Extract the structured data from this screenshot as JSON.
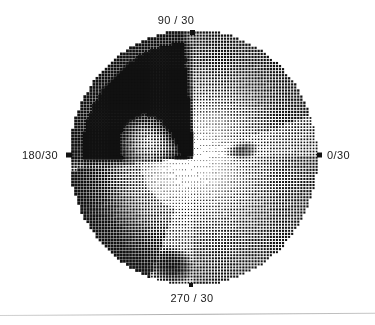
{
  "plot": {
    "kind": "visual-field-grayscale",
    "background_color": "#ffffff",
    "ink_color": "#111111",
    "center_x": 192,
    "center_y": 156,
    "radius_x": 124,
    "radius_y": 128,
    "dot_pitch": 3.05,
    "labels": {
      "top": "90 / 30",
      "left": "180/30",
      "right": "0/30",
      "bottom": "270 / 30"
    }
  },
  "chart_data": {
    "type": "heatmap",
    "title": "",
    "subtitle": "",
    "xlabel": "",
    "ylabel": "",
    "projection": "polar",
    "grid": false,
    "legend_position": "none",
    "shading": "halftone-dither",
    "radial_extent_deg": 30,
    "meridian_ticks": [
      {
        "angle_deg": 0,
        "label": "0/30"
      },
      {
        "angle_deg": 90,
        "label": "90 / 30"
      },
      {
        "angle_deg": 180,
        "label": "180/30"
      },
      {
        "angle_deg": 270,
        "label": "270 / 30"
      }
    ],
    "value_range": [
      0,
      1
    ],
    "value_meaning": "normalized darkness; 1 = fully saturated black defect, 0 = white / normal sensitivity",
    "regions": [
      {
        "name": "superior-nasal-dense-defect",
        "angle_deg_from": 90,
        "angle_deg_to": 186,
        "radius_from": 0,
        "radius_to": 30,
        "value": 1.0,
        "description": "solid black quadrant spanning upper-left, saturated"
      },
      {
        "name": "central-island-relative-sparing",
        "center_angle_deg": 163,
        "center_radius": 11,
        "extent_angle_deg": 34,
        "extent_radius": 8,
        "value": 0.28,
        "description": "light island inside the dense defect near horizontal meridian"
      },
      {
        "name": "inferior-nasal-arcuate",
        "angle_deg_from": 186,
        "angle_deg_to": 250,
        "radius_from": 13,
        "radius_to": 30,
        "value": 0.72,
        "description": "dark arcuate band along lower-left rim"
      },
      {
        "name": "superior-temporal-gradient",
        "angle_deg_from": 20,
        "angle_deg_to": 90,
        "radius_from": 0,
        "radius_to": 30,
        "value": 0.34,
        "description": "graded halftone thickening toward the rim"
      },
      {
        "name": "inferior-temporal-gradient",
        "angle_deg_from": 270,
        "angle_deg_to": 360,
        "radius_from": 0,
        "radius_to": 30,
        "value": 0.3,
        "description": "graded halftone thickening toward the rim"
      },
      {
        "name": "central-fixation-zone",
        "center_angle_deg": 315,
        "center_radius": 6,
        "extent_angle_deg": 360,
        "extent_radius": 9,
        "value": 0.18,
        "description": "lightest area just below and right of centre"
      },
      {
        "name": "inferior-rim-blob",
        "center_angle_deg": 258,
        "center_radius": 26,
        "extent_angle_deg": 18,
        "extent_radius": 6,
        "value": 0.88,
        "description": "small dark blob on the lower rim left of 270 meridian"
      },
      {
        "name": "paracentral-blob",
        "center_angle_deg": 8,
        "center_radius": 12,
        "extent_angle_deg": 14,
        "extent_radius": 5,
        "value": 0.66,
        "description": "small dark cluster right of centre near horizontal meridian"
      }
    ]
  }
}
